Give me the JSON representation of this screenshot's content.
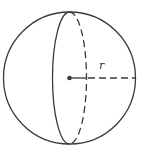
{
  "diagram": {
    "shape": "sphere",
    "radius_label": "r",
    "stroke_color": "#3a3a3a",
    "background": "#ffffff",
    "elements": [
      {
        "type": "circle",
        "description": "sphere outline",
        "style": "solid"
      },
      {
        "type": "ellipse",
        "description": "great circle front half",
        "style": "solid"
      },
      {
        "type": "ellipse",
        "description": "great circle back half",
        "style": "dashed"
      },
      {
        "type": "point",
        "description": "center"
      },
      {
        "type": "segment",
        "description": "radius from center to surface",
        "style": "solid then dashed",
        "label": "r"
      }
    ]
  }
}
